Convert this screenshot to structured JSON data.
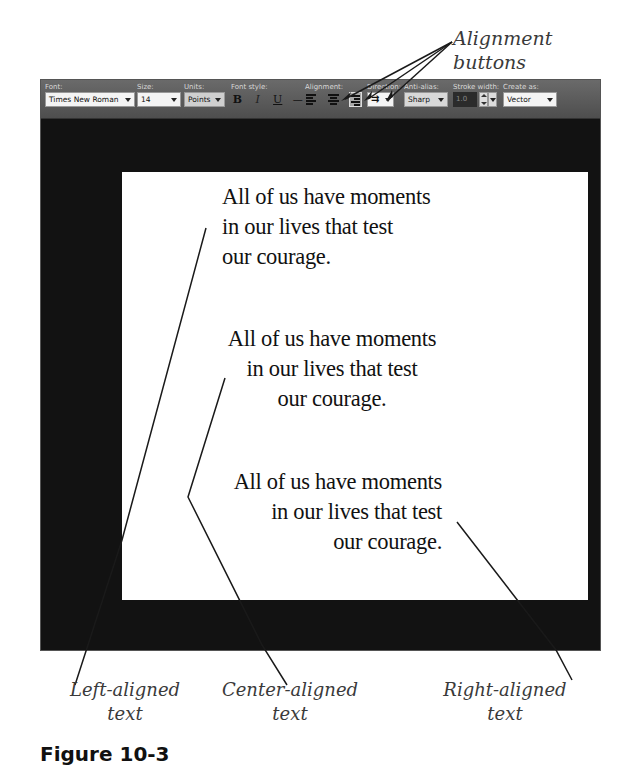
{
  "callouts": {
    "alignment_buttons": "Alignment buttons",
    "left_aligned": [
      "Left-aligned",
      "text"
    ],
    "center_aligned": [
      "Center-aligned",
      "text"
    ],
    "right_aligned": [
      "Right-aligned",
      "text"
    ]
  },
  "figure_caption": "Figure 10-3",
  "toolbar": {
    "font": {
      "label": "Font:",
      "value": "Times New Roman"
    },
    "size": {
      "label": "Size:",
      "value": "14"
    },
    "units": {
      "label": "Units:",
      "value": "Points"
    },
    "font_style": {
      "label": "Font style:",
      "bold": "B",
      "italic": "I",
      "underline": "U",
      "strikethrough": "—"
    },
    "alignment": {
      "label": "Alignment:",
      "options": [
        "left-align",
        "center-align",
        "right-align"
      ],
      "selected": "right-align"
    },
    "direction": {
      "label": "Direction:",
      "value": "horizontal"
    },
    "anti_alias": {
      "label": "Anti-alias:",
      "value": "Sharp"
    },
    "stroke_width": {
      "label": "Stroke width:",
      "value": "1.0"
    },
    "create_as": {
      "label": "Create as:",
      "value": "Vector"
    }
  },
  "canvas": {
    "blocks": [
      {
        "alignment": "left",
        "lines": [
          "All of us have moments",
          "in our lives that test",
          "our courage."
        ]
      },
      {
        "alignment": "center",
        "lines": [
          "All of us have moments",
          "in our lives that test",
          "our courage."
        ]
      },
      {
        "alignment": "right",
        "lines": [
          "All of us have moments",
          "in our lives that test",
          "our courage."
        ]
      }
    ]
  },
  "colors": {
    "toolbar_bg": "#5a5a5a",
    "canvas_bg": "#121212",
    "page_bg": "#ffffff",
    "callout_text": "#3a3a3a"
  }
}
